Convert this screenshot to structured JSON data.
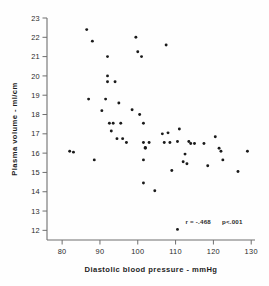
{
  "chart_data": {
    "type": "scatter",
    "title": "",
    "xlabel": "Diastolic blood pressure - mmHg",
    "ylabel": "Plasma volume - ml/cm",
    "xlim": [
      76,
      131
    ],
    "ylim": [
      11.5,
      23
    ],
    "xticks": [
      80,
      90,
      100,
      110,
      120,
      130
    ],
    "xtick_labels": [
      "80",
      "90",
      "100",
      "110",
      "120",
      "130"
    ],
    "yticks": [
      12,
      13,
      14,
      15,
      16,
      17,
      18,
      19,
      20,
      21,
      22,
      23
    ],
    "ytick_labels": [
      "12",
      "13",
      "14",
      "15",
      "16",
      "17",
      "18",
      "19",
      "20",
      "21",
      "22",
      "23"
    ],
    "grid": false,
    "legend": null,
    "marker": "filled-circle",
    "marker_color": "#1a1a1a",
    "annotations": [
      {
        "name": "correlation",
        "text": "r = -.468",
        "x": 116,
        "y": 12.35
      },
      {
        "name": "p-value",
        "text": "p<.001",
        "x": 125,
        "y": 12.35
      }
    ],
    "x": [
      82.0,
      83.0,
      86.5,
      87.0,
      88.0,
      88.5,
      90.5,
      91.5,
      92.0,
      92.0,
      92.0,
      92.5,
      93.0,
      93.5,
      94.0,
      94.5,
      95.0,
      95.5,
      96.0,
      97.0,
      98.5,
      99.5,
      100.0,
      100.5,
      101.0,
      101.5,
      101.5,
      101.5,
      101.5,
      102.0,
      102.0,
      103.0,
      104.5,
      106.5,
      107.0,
      107.5,
      108.0,
      108.5,
      109.0,
      110.5,
      110.5,
      111.0,
      112.0,
      112.5,
      113.0,
      113.5,
      114.0,
      115.0,
      117.5,
      118.5,
      120.5,
      121.5,
      122.0,
      122.5,
      126.5,
      129.0
    ],
    "y": [
      16.1,
      16.05,
      22.4,
      18.8,
      21.8,
      15.65,
      18.2,
      18.8,
      20.0,
      19.7,
      21.0,
      17.55,
      17.15,
      17.55,
      19.7,
      16.75,
      18.6,
      17.55,
      16.75,
      16.55,
      18.25,
      22.0,
      21.25,
      18.0,
      21.0,
      17.55,
      16.55,
      15.65,
      14.45,
      16.25,
      16.3,
      16.55,
      14.05,
      17.0,
      16.55,
      21.6,
      17.05,
      16.55,
      15.1,
      12.05,
      16.6,
      17.25,
      15.55,
      15.95,
      15.45,
      16.6,
      16.5,
      16.5,
      16.5,
      15.35,
      16.85,
      16.25,
      16.1,
      15.65,
      15.05,
      16.1
    ]
  },
  "figure": {
    "axis_color": "#6f6f6f",
    "point_color": "#1a1a1a",
    "background": "#fefefe"
  }
}
